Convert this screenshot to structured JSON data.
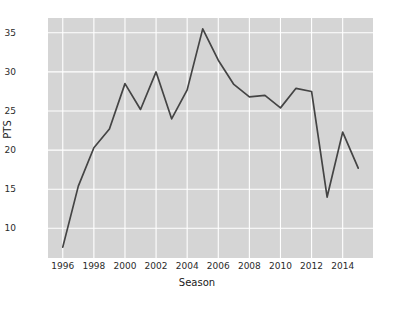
{
  "chart_data": {
    "type": "line",
    "title": "",
    "xlabel": "Season",
    "ylabel": "PTS",
    "xlim": [
      1995.3,
      1995.3
    ],
    "ylim": [
      7.0,
      36.4
    ],
    "grid": true,
    "legend": false,
    "x": [
      1996,
      1997,
      1998,
      1999,
      2000,
      2001,
      2002,
      2003,
      2004,
      2005,
      2006,
      2007,
      2008,
      2009,
      2010,
      2011,
      2012,
      2013,
      2014,
      2015
    ],
    "values": [
      7.6,
      15.4,
      20.3,
      22.7,
      28.5,
      25.2,
      30.0,
      24.0,
      27.7,
      35.5,
      31.5,
      28.4,
      26.8,
      27.0,
      25.4,
      27.9,
      27.5,
      14.0,
      22.3,
      17.7
    ],
    "series": [
      {
        "name": "PTS",
        "color": "#444444",
        "values": [
          7.6,
          15.4,
          20.3,
          22.7,
          28.5,
          25.2,
          30.0,
          24.0,
          27.7,
          35.5,
          31.5,
          28.4,
          26.8,
          27.0,
          25.4,
          27.9,
          27.5,
          14.0,
          22.3,
          17.7
        ]
      }
    ],
    "xticks": [
      1996,
      1998,
      2000,
      2002,
      2004,
      2006,
      2008,
      2010,
      2012,
      2014
    ],
    "xtick_labels": [
      "1996",
      "1998",
      "2000",
      "2002",
      "2004",
      "2006",
      "2008",
      "2010",
      "2012",
      "2014"
    ],
    "yticks": [
      10,
      15,
      20,
      25,
      30,
      35
    ],
    "ytick_labels": [
      "10",
      "15",
      "20",
      "25",
      "30",
      "35"
    ],
    "style": {
      "axes_background": "#d5d5d5",
      "grid_color": "#ffffff",
      "figure_background": "#ffffff",
      "line_color": "#444444",
      "tick_label_color": "#2b2b2b"
    }
  }
}
